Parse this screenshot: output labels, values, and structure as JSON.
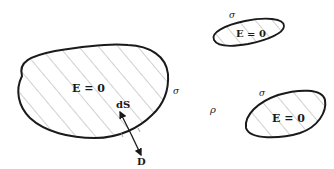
{
  "diagram": {
    "conductors": [
      {
        "id": "large",
        "interior_label": "E = 0",
        "surface_label": "σ"
      },
      {
        "id": "small-top",
        "interior_label": "E = 0",
        "surface_label": "σ"
      },
      {
        "id": "small-bottom",
        "interior_label": "E = 0",
        "surface_label": "σ"
      }
    ],
    "region_label": "ρ",
    "surface_element_label": "dS",
    "field_label": "D",
    "colors": {
      "stroke": "#1a1a1a",
      "hatch": "#8a8a8a",
      "background": "#ffffff"
    }
  }
}
